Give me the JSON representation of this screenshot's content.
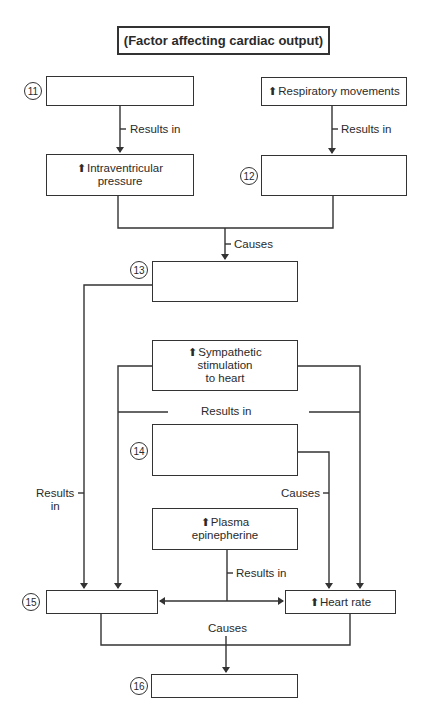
{
  "title": "(Factor affecting cardiac output)",
  "up_arrow": "⬆",
  "boxes": {
    "b11": {
      "number": "11",
      "text": ""
    },
    "respiratory": {
      "text": "Respiratory movements"
    },
    "intraventricular": {
      "line1": "Intraventricular",
      "line2": "pressure"
    },
    "b12": {
      "number": "12",
      "text": ""
    },
    "b13": {
      "number": "13",
      "text": ""
    },
    "sympathetic": {
      "line1": "Sympathetic",
      "line2": "stimulation",
      "line3": "to heart"
    },
    "b14": {
      "number": "14",
      "text": ""
    },
    "plasma": {
      "line1": "Plasma",
      "line2": "epinepherine"
    },
    "b15": {
      "number": "15",
      "text": ""
    },
    "heart_rate": {
      "text": "Heart rate"
    },
    "b16": {
      "number": "16",
      "text": ""
    }
  },
  "labels": {
    "results_in_1": "Results in",
    "results_in_2": "Results in",
    "causes_1": "Causes",
    "results_in_3": "Results in",
    "results_in_left_1": "Results",
    "results_in_left_2": "in",
    "causes_2": "Causes",
    "results_in_4": "Results in",
    "causes_3": "Causes"
  }
}
